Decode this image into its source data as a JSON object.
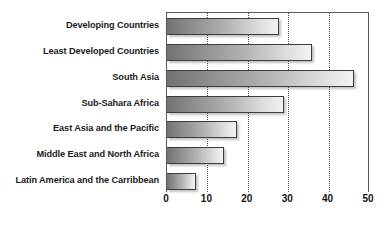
{
  "chart_data": {
    "type": "bar",
    "orientation": "horizontal",
    "title": "",
    "xlabel": "",
    "ylabel": "",
    "categories": [
      "Developing Countries",
      "Least Developed Countries",
      "South Asia",
      "Sub-Sahara Africa",
      "East Asia and the Pacific",
      "Middle East and North Africa",
      "Latin America and the Carribbean"
    ],
    "values": [
      27.8,
      36,
      46.4,
      29,
      17.3,
      14,
      7.2
    ],
    "xlim": [
      0,
      50
    ],
    "xticks": [
      0,
      10,
      20,
      30,
      40,
      50
    ],
    "xtick_labels": [
      "0",
      "10",
      "20",
      "30",
      "40",
      "50"
    ],
    "gridlines": [
      10,
      20,
      30,
      40
    ],
    "grid": true,
    "legend": "none",
    "bar_fill_start": "#727272",
    "bar_fill_end": "#f2f2f2",
    "bar_border_color": "#3d3d3d",
    "axis_color": "#555a5e",
    "label_color": "#1c1c1c"
  }
}
